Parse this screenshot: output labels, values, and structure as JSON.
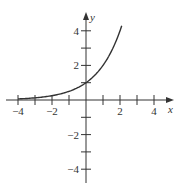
{
  "chart_data": {
    "type": "line",
    "title": "",
    "xlabel": "x",
    "ylabel": "y",
    "function": "y = 2^x",
    "xlim": [
      -4.6,
      5
    ],
    "ylim": [
      -4.8,
      5
    ],
    "x_ticks": [
      -4,
      -3,
      -2,
      -1,
      1,
      2,
      3,
      4
    ],
    "x_tick_labels": [
      "-4",
      "-2",
      "2",
      "4"
    ],
    "x_tick_label_values": [
      -4,
      -2,
      2,
      4
    ],
    "y_ticks": [
      -4,
      -3,
      -2,
      -1,
      1,
      2,
      3,
      4
    ],
    "y_tick_labels": [
      "4",
      "2",
      "-2",
      "-4"
    ],
    "y_tick_label_values": [
      4,
      2,
      -2,
      -4
    ],
    "grid": false,
    "legend": null,
    "series": [
      {
        "name": "y = 2^x",
        "x": [
          -4,
          -3,
          -2,
          -1,
          0,
          0.5,
          1,
          1.5,
          2,
          2.1
        ],
        "values": [
          0.0625,
          0.125,
          0.25,
          0.5,
          1,
          1.414,
          2,
          2.828,
          4,
          4.287
        ]
      }
    ],
    "colors": {
      "curve": "#333333",
      "axes": "#333333"
    }
  }
}
